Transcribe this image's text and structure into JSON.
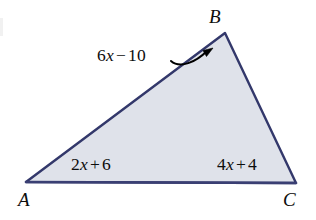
{
  "figure": {
    "type": "geometry-diagram",
    "shape": "triangle",
    "colors": {
      "fill": "#dfe2ea",
      "stroke": "#33386b",
      "text": "#0d0d0d",
      "arrow": "#000000",
      "background": "#ffffff"
    },
    "vertices": [
      {
        "name": "A",
        "label": "A",
        "x": 26,
        "y": 182,
        "label_x": 18,
        "label_y": 190
      },
      {
        "name": "B",
        "label": "B",
        "x": 225,
        "y": 33,
        "label_x": 209,
        "label_y": 7
      },
      {
        "name": "C",
        "label": "C",
        "x": 296,
        "y": 183,
        "label_x": 283,
        "label_y": 190
      }
    ],
    "side_labels": [
      {
        "id": "side-AB",
        "text": "6x − 10",
        "coefficient": "6",
        "variable": "x",
        "operator": "−",
        "constant": "10",
        "side": "AB",
        "has_leader_arrow": true
      },
      {
        "id": "side-AC",
        "text": "2x + 6",
        "coefficient": "2",
        "variable": "x",
        "operator": "+",
        "constant": "6",
        "side": "AC",
        "has_leader_arrow": false
      },
      {
        "id": "side-BC",
        "text": "4x + 4",
        "coefficient": "4",
        "variable": "x",
        "operator": "+",
        "constant": "4",
        "side": "BC",
        "has_leader_arrow": false
      }
    ],
    "leader_arrow": {
      "name": "curved-leader-arrow",
      "from_x": 171,
      "from_y": 61,
      "to_x": 213,
      "to_y": 49
    }
  }
}
